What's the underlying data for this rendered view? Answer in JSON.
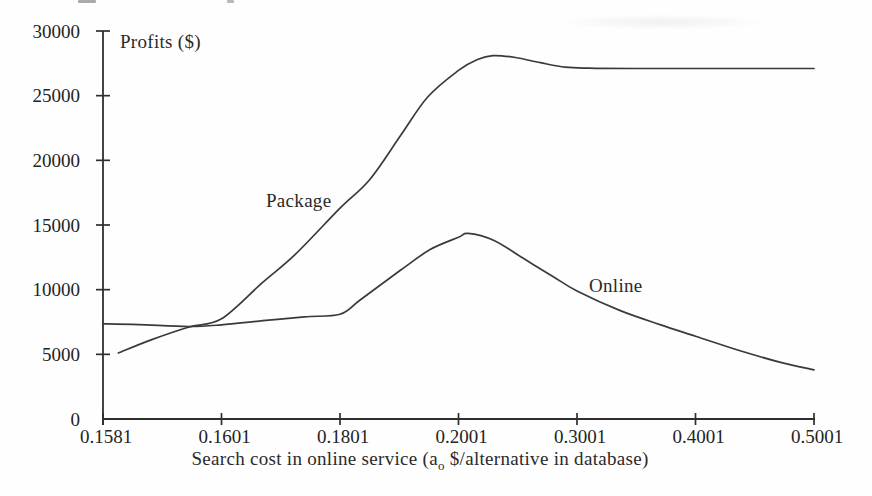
{
  "figure": {
    "background": "#fefefe",
    "ink_color": "#2f2f2f",
    "curve_color": "#3a3a3a"
  },
  "chart_data": {
    "type": "line",
    "title": "",
    "ylabel": "Profits ($)",
    "xlabel_parts": {
      "pre": "Search cost in online service (a",
      "sub": "o",
      "post": " $/alternative in database)"
    },
    "x_tick_labels": [
      "0.1581",
      "0.1601",
      "0.1801",
      "0.2001",
      "0.3001",
      "0.4001",
      "0.5001"
    ],
    "x_tick_values": [
      0.1581,
      0.1601,
      0.1801,
      0.2001,
      0.3001,
      0.4001,
      0.5001
    ],
    "x_axis_note": "ticks evenly spaced despite non-uniform values (category-spaced axis)",
    "y_tick_values": [
      0,
      5000,
      10000,
      15000,
      20000,
      25000,
      30000
    ],
    "ylim": [
      0,
      30000
    ],
    "grid": false,
    "legend": "inline-annotations",
    "series": [
      {
        "name": "Package",
        "description": "starts low (~5100 near x=0.1581), rises steeply, peaks ~28100 just after x=0.2001, settles flat at ~27100 through x=0.5001",
        "values_at_x_ticks": [
          5300,
          7750,
          16300,
          26950,
          27100,
          27100,
          27100
        ],
        "peak": {
          "value": 28100,
          "near_x": 0.22
        },
        "points_t": [
          [
            0.13,
            5100
          ],
          [
            0.4,
            6100
          ],
          [
            0.72,
            7100
          ],
          [
            1.0,
            7750
          ],
          [
            1.34,
            10500
          ],
          [
            1.62,
            12700
          ],
          [
            2.0,
            16300
          ],
          [
            2.25,
            18500
          ],
          [
            2.51,
            21900
          ],
          [
            2.74,
            24900
          ],
          [
            3.0,
            26950
          ],
          [
            3.16,
            27800
          ],
          [
            3.29,
            28100
          ],
          [
            3.48,
            27950
          ],
          [
            3.69,
            27550
          ],
          [
            3.9,
            27200
          ],
          [
            4.1,
            27120
          ],
          [
            4.5,
            27100
          ],
          [
            5.0,
            27100
          ],
          [
            5.5,
            27100
          ],
          [
            6.0,
            27100
          ]
        ]
      },
      {
        "name": "Online",
        "description": "starts ~7350 at x=0.1581, nearly flat (crosses Package near x=0.1596), rises to peak ~14350 just after x=0.2001, then declines steadily to ~3800 at x=0.5001",
        "values_at_x_ticks": [
          7350,
          7280,
          8100,
          14050,
          9900,
          6400,
          3800
        ],
        "peak": {
          "value": 14350,
          "near_x": 0.205
        },
        "points_t": [
          [
            0.0,
            7350
          ],
          [
            0.3,
            7300
          ],
          [
            0.72,
            7150
          ],
          [
            1.0,
            7280
          ],
          [
            1.35,
            7600
          ],
          [
            1.7,
            7900
          ],
          [
            2.0,
            8100
          ],
          [
            2.17,
            9200
          ],
          [
            2.51,
            11500
          ],
          [
            2.76,
            13100
          ],
          [
            3.0,
            14050
          ],
          [
            3.08,
            14350
          ],
          [
            3.3,
            13800
          ],
          [
            3.55,
            12400
          ],
          [
            3.8,
            11000
          ],
          [
            4.0,
            9900
          ],
          [
            4.36,
            8400
          ],
          [
            4.7,
            7300
          ],
          [
            5.0,
            6400
          ],
          [
            5.37,
            5300
          ],
          [
            5.71,
            4400
          ],
          [
            6.0,
            3800
          ]
        ]
      }
    ],
    "points_t_format": "[tick_index_position, profit_dollars]; tick_index 0..6 maps to x_tick_labels"
  }
}
